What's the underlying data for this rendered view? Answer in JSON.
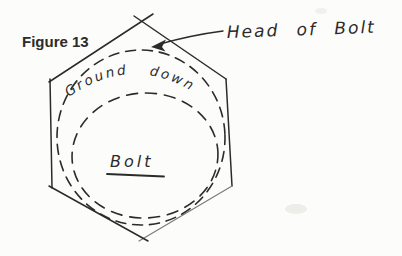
{
  "figure": {
    "label": "Figure 13"
  },
  "diagram": {
    "head_of_bolt_label": "Head of Bolt",
    "ground_down_label": "Ground down",
    "bolt_label": "Bolt"
  },
  "colors": {
    "ink": "#2b2b2b",
    "ink_light": "#7d7d76",
    "paper": "#fcfcfa"
  }
}
